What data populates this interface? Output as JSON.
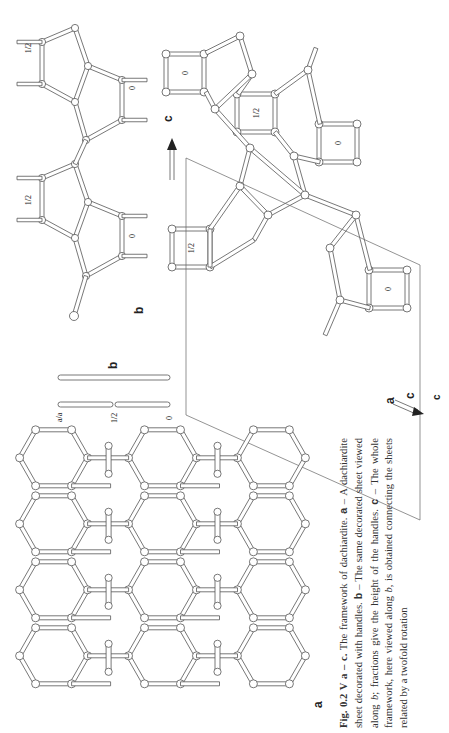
{
  "page": {
    "orientation": "rotated-90-ccw",
    "background": "#ffffff"
  },
  "figure": {
    "id": "Fig. 0.2 V a – c.",
    "panels": {
      "a": {
        "label": "a",
        "description": "dachiardite sheet decorated with handles (net of 5- and 6-rings)"
      },
      "b": {
        "label": "b",
        "axis_label": "b",
        "height_labels": [
          "a/a",
          "1/2",
          "0"
        ]
      },
      "b_detail": {
        "label": "b",
        "handle_labels": [
          "1/2",
          "0"
        ]
      },
      "c": {
        "label": "c",
        "axis_arrow_label": "c",
        "axis_a_label": "a",
        "axis_c_label": "c",
        "ring_labels": [
          "0",
          "1/2",
          "0",
          "1/2",
          "0"
        ]
      }
    }
  },
  "caption": {
    "fig_number": "Fig. 0.2 V a – c.",
    "text_1": " The framework of dachiardite. ",
    "a": "a",
    "text_2": " – A dachiardite sheet decorated with handles. ",
    "b": "b",
    "text_3": " – The same decorated sheet viewed along ",
    "b_italic": "b",
    "text_4": "; fractions give the height of the handles. ",
    "c": "c",
    "text_5": " – The whole framework, here viewed along ",
    "b_italic2": "b",
    "text_6": ", is obtained connecting the sheets related by a twofold rotation"
  }
}
